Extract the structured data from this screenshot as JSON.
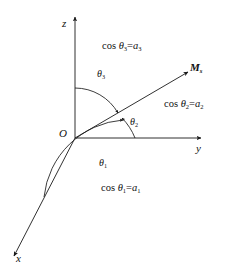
{
  "figure": {
    "background_color": "#ffffff",
    "line_color": "#1a1a1a",
    "axes": {
      "z_label": "z",
      "y_label": "y",
      "x_label": "x",
      "origin_label": "O"
    },
    "vector": {
      "label": "M",
      "subscript": "s"
    },
    "angles": [
      {
        "name": "theta-1",
        "symbol": "θ",
        "subscript": "1"
      },
      {
        "name": "theta-2",
        "symbol": "θ",
        "subscript": "2"
      },
      {
        "name": "theta-3",
        "symbol": "θ",
        "subscript": "3"
      }
    ],
    "equations": [
      {
        "name": "cos-theta3",
        "fn": "cos ",
        "sym": "θ",
        "sub": "3",
        "eq": "=",
        "rhs": "a",
        "rhs_sub": "3"
      },
      {
        "name": "cos-theta2",
        "fn": "cos ",
        "sym": "θ",
        "sub": "2",
        "eq": "=",
        "rhs": "a",
        "rhs_sub": "2"
      },
      {
        "name": "cos-theta1",
        "fn": "cos ",
        "sym": "θ",
        "sub": "1",
        "eq": "=",
        "rhs": "a",
        "rhs_sub": "1"
      }
    ],
    "top_artifact": "          "
  }
}
